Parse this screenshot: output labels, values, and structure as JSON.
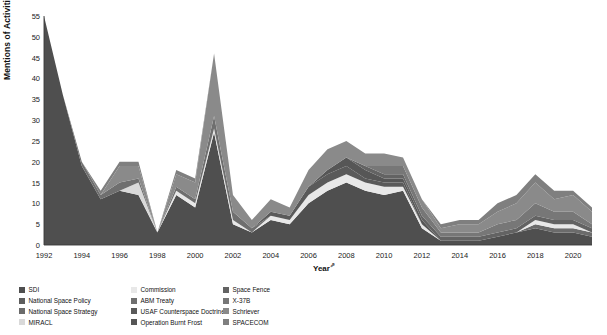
{
  "chart_data": {
    "type": "area",
    "stacked": true,
    "title": "",
    "xlabel": "Year",
    "xlabel_glyph": "⇗",
    "ylabel": "Mentions of Activities",
    "ylim": [
      0,
      55
    ],
    "yticks": [
      0,
      5,
      10,
      15,
      20,
      25,
      30,
      35,
      40,
      45,
      50,
      55
    ],
    "xticks": [
      1992,
      1994,
      1996,
      1998,
      2000,
      2002,
      2004,
      2006,
      2008,
      2010,
      2012,
      2014,
      2016,
      2018,
      2020
    ],
    "xlim": [
      1992,
      2021
    ],
    "grid": false,
    "legend_position": "bottom",
    "legend_columns": 3,
    "x": [
      1992,
      1993,
      1994,
      1995,
      1996,
      1997,
      1998,
      1999,
      2000,
      2001,
      2002,
      2003,
      2004,
      2005,
      2006,
      2007,
      2008,
      2009,
      2010,
      2011,
      2012,
      2013,
      2014,
      2015,
      2016,
      2017,
      2018,
      2019,
      2020,
      2021
    ],
    "series": [
      {
        "name": "SDI",
        "color": "#4f4f4f",
        "values": [
          55,
          36,
          19,
          11,
          13,
          12,
          3,
          12,
          9,
          27,
          5,
          3,
          6,
          5,
          10,
          13,
          15,
          13,
          12,
          13,
          4,
          1,
          1,
          1,
          2,
          3,
          4,
          3,
          3,
          2
        ]
      },
      {
        "name": "National Space Policy",
        "color": "#5d5d5d",
        "values": [
          0,
          0,
          0,
          0,
          0,
          0,
          0,
          0,
          0,
          0,
          0,
          0,
          0,
          0,
          0,
          0,
          0,
          0,
          0,
          0,
          0,
          0,
          0,
          0,
          0,
          0,
          0,
          0,
          0,
          0
        ]
      },
      {
        "name": "National Space Strategy",
        "color": "#6b6b6b",
        "values": [
          0,
          0,
          0,
          0,
          0,
          0,
          0,
          0,
          0,
          0,
          0,
          0,
          0,
          0,
          0,
          0,
          0,
          0,
          0,
          0,
          0,
          0,
          0,
          0,
          0,
          0,
          1,
          1,
          1,
          1
        ]
      },
      {
        "name": "MIRACL",
        "color": "#d9d9d9",
        "values": [
          0,
          0,
          0,
          0,
          0,
          3,
          0,
          0,
          0,
          0,
          0,
          0,
          0,
          0,
          0,
          0,
          0,
          0,
          0,
          0,
          0,
          0,
          0,
          0,
          0,
          0,
          0,
          0,
          0,
          0
        ]
      },
      {
        "name": "Commission",
        "color": "#e8e8e8",
        "values": [
          0,
          0,
          0,
          0,
          0,
          0,
          0,
          1,
          1,
          1,
          1,
          0,
          1,
          1,
          2,
          2,
          2,
          2,
          2,
          1,
          1,
          0,
          0,
          0,
          0,
          0,
          1,
          1,
          1,
          0
        ]
      },
      {
        "name": "ABM Treaty",
        "color": "#6f6f6f",
        "values": [
          0,
          0,
          1,
          1,
          2,
          1,
          0,
          1,
          1,
          3,
          2,
          1,
          0,
          0,
          0,
          0,
          0,
          0,
          0,
          0,
          0,
          0,
          0,
          0,
          0,
          0,
          0,
          0,
          0,
          0
        ]
      },
      {
        "name": "USAF Counterspace Doctrine",
        "color": "#5a5a5a",
        "values": [
          0,
          0,
          0,
          0,
          0,
          0,
          0,
          0,
          0,
          0,
          0,
          0,
          1,
          1,
          2,
          2,
          2,
          1,
          1,
          1,
          0,
          0,
          0,
          0,
          0,
          0,
          0,
          0,
          0,
          0
        ]
      },
      {
        "name": "Operation Burnt Frost",
        "color": "#565656",
        "values": [
          0,
          0,
          0,
          0,
          0,
          0,
          0,
          0,
          0,
          0,
          0,
          0,
          0,
          0,
          0,
          1,
          2,
          2,
          1,
          1,
          1,
          0,
          0,
          0,
          0,
          0,
          0,
          0,
          0,
          0
        ]
      },
      {
        "name": "Space Fence",
        "color": "#636363",
        "values": [
          0,
          0,
          0,
          0,
          0,
          0,
          0,
          0,
          0,
          0,
          0,
          0,
          0,
          0,
          0,
          0,
          0,
          1,
          1,
          1,
          1,
          1,
          1,
          1,
          1,
          1,
          1,
          1,
          1,
          1
        ]
      },
      {
        "name": "X-37B",
        "color": "#777777",
        "values": [
          0,
          0,
          0,
          0,
          0,
          0,
          0,
          0,
          0,
          0,
          0,
          0,
          0,
          0,
          0,
          0,
          0,
          0,
          2,
          2,
          2,
          1,
          1,
          1,
          2,
          2,
          3,
          2,
          2,
          1
        ]
      },
      {
        "name": "Schriever",
        "color": "#8a8a8a",
        "values": [
          0,
          0,
          0,
          0,
          4,
          3,
          0,
          3,
          4,
          15,
          4,
          2,
          3,
          2,
          4,
          5,
          4,
          3,
          3,
          2,
          2,
          1,
          2,
          2,
          3,
          4,
          5,
          3,
          4,
          3
        ]
      },
      {
        "name": "SPACECOM",
        "color": "#7f7f7f",
        "values": [
          0,
          0,
          0,
          1,
          1,
          1,
          0,
          1,
          1,
          0,
          0,
          0,
          0,
          0,
          0,
          0,
          0,
          0,
          0,
          0,
          0,
          1,
          1,
          1,
          2,
          2,
          2,
          2,
          1,
          1
        ]
      }
    ]
  },
  "legend": {
    "columns": [
      [
        "SDI",
        "National Space Policy",
        "National Space Strategy",
        "MIRACL"
      ],
      [
        "Commission",
        "ABM Treaty",
        "USAF Counterspace Doctrine",
        "Operation Burnt Frost"
      ],
      [
        "Space Fence",
        "X-37B",
        "Schriever",
        "SPACECOM"
      ]
    ]
  }
}
